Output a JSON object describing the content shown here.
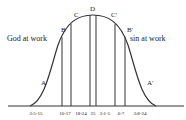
{
  "diagram": {
    "left_caption": "God at work",
    "right_caption": "sin at work",
    "curve_points": {
      "A": "A",
      "B": "B",
      "C": "C",
      "D": "D",
      "C_prime": "C'",
      "B_prime": "B'",
      "A_prime": "A'"
    },
    "ticks": [
      "2:5-15",
      "16-17",
      "18-24",
      "25",
      "3:1-5",
      "6-7",
      "3:8-24"
    ],
    "colors": {
      "line": "#333333",
      "text": "#222222",
      "background": "#ffffff"
    }
  }
}
